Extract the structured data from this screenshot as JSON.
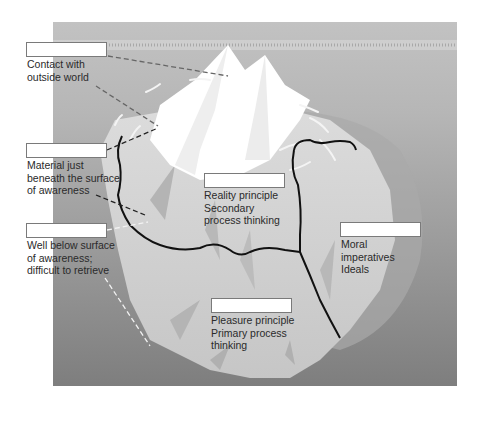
{
  "diagram": {
    "colors": {
      "sky": "#bdbdbd",
      "water_deep": "#8c8c8c",
      "ice_above": "#ffffff",
      "ice_below": "#d2d2d2",
      "boundary_line": "#111111"
    },
    "labels": [
      {
        "id": "contact",
        "box": "",
        "lines": [
          "Contact with",
          "outside world"
        ]
      },
      {
        "id": "material",
        "box": "",
        "lines": [
          "Material just",
          "beneath the surface",
          "of awareness"
        ]
      },
      {
        "id": "well_below",
        "box": "",
        "lines": [
          "Well below surface",
          "of awareness;",
          "difficult to retrieve"
        ]
      },
      {
        "id": "reality",
        "box": "",
        "lines": [
          "Reality principle",
          "Secondary",
          "process thinking"
        ]
      },
      {
        "id": "moral",
        "box": "",
        "lines": [
          "Moral",
          "imperatives",
          "Ideals"
        ]
      },
      {
        "id": "pleasure",
        "box": "",
        "lines": [
          "Pleasure principle",
          "Primary process",
          "thinking"
        ]
      }
    ]
  }
}
